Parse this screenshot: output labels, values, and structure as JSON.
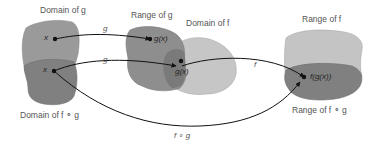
{
  "diagram": {
    "colors": {
      "dark_region": "#8a8a8a",
      "mid_region": "#a0a0a0",
      "light_region": "#c8c8c8",
      "overlap_region": "#7a7a7a",
      "arrow": "#111111",
      "label": "#555555"
    },
    "labels": {
      "domain_g": "Domain of g",
      "range_g": "Range of g",
      "domain_f": "Domain of f",
      "range_f": "Range of f",
      "domain_fog": "Domain of f ∘ g",
      "range_fog": "Range of f ∘ g"
    },
    "points": {
      "x_top": "x",
      "x_bottom": "x",
      "gx_top": "g(x)",
      "gx_bottom": "g(x)",
      "fgx": "f(g(x))"
    },
    "arrows": {
      "g_top": "g",
      "g_bottom": "g",
      "f": "f",
      "fog": "f ∘ g"
    }
  }
}
